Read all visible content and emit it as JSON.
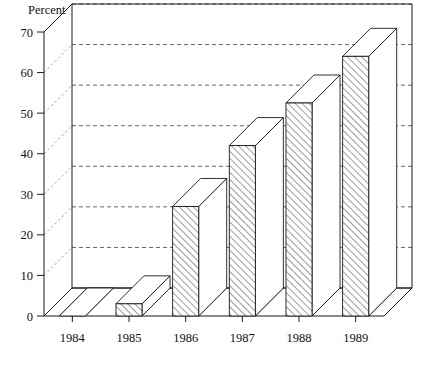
{
  "chart_data": {
    "type": "bar",
    "title": "",
    "subtitle": "",
    "xlabel": "",
    "ylabel": "Percent",
    "categories": [
      "1984",
      "1985",
      "1986",
      "1987",
      "1988",
      "1989"
    ],
    "values": [
      0,
      3,
      27,
      42,
      52.5,
      64
    ],
    "series": [
      {
        "name": "Percent",
        "values": [
          0,
          3,
          27,
          42,
          52.5,
          64
        ]
      }
    ],
    "ylim": [
      0,
      70
    ],
    "ytick_labels": [
      "0",
      "10",
      "20",
      "30",
      "40",
      "50",
      "60",
      "70"
    ],
    "ytick_values": [
      0,
      10,
      20,
      30,
      40,
      50,
      60,
      70
    ],
    "grid": true,
    "grid_axis": "y",
    "gridline_style": "dashed",
    "legend": false,
    "legend_position": "none",
    "projection": "3d-isometric",
    "bar_fill": "diagonal-hatch",
    "style": "black-and-white line art",
    "annotations": []
  },
  "figure": {
    "y_axis_title": "Percent",
    "background_color": "#ffffff",
    "line_color": "#1a1a1a",
    "grid_color": "#555555",
    "hatch_color": "#4a4a4a"
  }
}
